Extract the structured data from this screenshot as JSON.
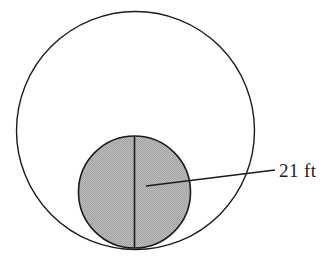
{
  "figure": {
    "type": "geometry-diagram",
    "background_color": "#ffffff",
    "stroke_color": "#1b1b1b",
    "shaded_fill_color": "#b3b3b3",
    "outer_circle": {
      "name": "outer-circle",
      "center_x": 135.5,
      "center_y": 130.5,
      "radius": 119,
      "fill": "none",
      "stroke_width": 1.4
    },
    "inner_circle": {
      "name": "inner-shaded-circle",
      "center_x": 134.5,
      "center_y": 192,
      "radius": 56,
      "fill": "#b3b3b3",
      "stroke_width": 1.6
    },
    "diameter_line": {
      "name": "vertical-diameter-line",
      "x1": 134.5,
      "y1": 136,
      "x2": 134.5,
      "y2": 248,
      "stroke_width": 1.6
    },
    "leader_line": {
      "name": "radius-leader-line",
      "x1": 146,
      "y1": 186,
      "x2": 275,
      "y2": 170,
      "stroke_width": 1.4
    },
    "dimension_label": {
      "name": "radius-dimension-label",
      "text": "21 ft",
      "value": 21,
      "unit": "ft",
      "x": 279,
      "y": 177
    }
  }
}
